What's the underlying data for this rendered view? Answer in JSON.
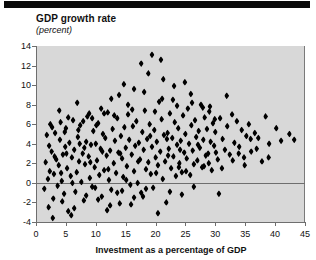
{
  "figure": {
    "title": "GDP growth rate",
    "subtitle": "(percent)",
    "xaxis_title": "Investment as a percentage of GDP"
  },
  "colors": {
    "marker": "#000000",
    "plot_background": "#d8d8d8",
    "axis": "#6e6e6e",
    "page_background": "#ffffff",
    "top_rule": "#0a0a0a"
  },
  "chart_data": {
    "type": "scatter",
    "title": "GDP growth rate",
    "subtitle": "(percent)",
    "xlabel": "Investment as a percentage of GDP",
    "ylabel": "GDP growth rate (percent)",
    "xlim": [
      0,
      45
    ],
    "ylim": [
      -4,
      14
    ],
    "xticks": [
      0,
      5,
      10,
      15,
      20,
      25,
      30,
      35,
      40,
      45
    ],
    "yticks": [
      -4,
      -2,
      0,
      2,
      4,
      6,
      8,
      10,
      12,
      14
    ],
    "grid": false,
    "legend": null,
    "zero_line": 0,
    "marker": "diamond",
    "n_points": 256,
    "points": [
      [
        1.4,
        -0.6
      ],
      [
        1.6,
        2.1
      ],
      [
        1.8,
        4.9
      ],
      [
        2.0,
        0.4
      ],
      [
        2.1,
        -2.5
      ],
      [
        2.3,
        1.2
      ],
      [
        2.4,
        6.0
      ],
      [
        2.6,
        3.2
      ],
      [
        2.8,
        -3.6
      ],
      [
        3.0,
        0.9
      ],
      [
        3.2,
        5.1
      ],
      [
        3.4,
        2.4
      ],
      [
        3.6,
        -0.3
      ],
      [
        3.8,
        1.8
      ],
      [
        4.0,
        4.4
      ],
      [
        4.1,
        6.2
      ],
      [
        4.3,
        0.2
      ],
      [
        4.5,
        2.9
      ],
      [
        4.7,
        -1.1
      ],
      [
        4.9,
        3.7
      ],
      [
        5.0,
        5.6
      ],
      [
        5.2,
        1.5
      ],
      [
        5.4,
        -2.9
      ],
      [
        5.6,
        4.1
      ],
      [
        5.8,
        0.7
      ],
      [
        6.0,
        2.6
      ],
      [
        6.2,
        6.4
      ],
      [
        6.4,
        3.4
      ],
      [
        6.6,
        -0.9
      ],
      [
        6.8,
        1.1
      ],
      [
        7.0,
        4.7
      ],
      [
        7.2,
        2.2
      ],
      [
        7.4,
        5.9
      ],
      [
        7.6,
        0.1
      ],
      [
        7.8,
        3.0
      ],
      [
        8.0,
        -1.8
      ],
      [
        8.2,
        1.9
      ],
      [
        8.4,
        4.2
      ],
      [
        8.6,
        6.8
      ],
      [
        8.8,
        2.7
      ],
      [
        9.0,
        0.5
      ],
      [
        9.2,
        3.9
      ],
      [
        9.4,
        -0.4
      ],
      [
        9.6,
        5.3
      ],
      [
        9.8,
        1.6
      ],
      [
        10.0,
        4.0
      ],
      [
        10.2,
        2.3
      ],
      [
        10.4,
        6.1
      ],
      [
        10.6,
        0.8
      ],
      [
        10.8,
        3.5
      ],
      [
        11.0,
        -1.4
      ],
      [
        11.2,
        5.0
      ],
      [
        11.4,
        1.3
      ],
      [
        11.6,
        4.6
      ],
      [
        11.8,
        2.8
      ],
      [
        12.0,
        7.2
      ],
      [
        12.2,
        0.3
      ],
      [
        12.4,
        3.3
      ],
      [
        12.6,
        -0.7
      ],
      [
        12.8,
        5.5
      ],
      [
        13.0,
        2.0
      ],
      [
        13.2,
        4.3
      ],
      [
        13.4,
        1.0
      ],
      [
        13.6,
        6.6
      ],
      [
        13.8,
        3.1
      ],
      [
        14.0,
        -2.1
      ],
      [
        14.2,
        4.8
      ],
      [
        14.4,
        2.5
      ],
      [
        14.6,
        0.6
      ],
      [
        14.8,
        5.7
      ],
      [
        15.0,
        3.6
      ],
      [
        15.2,
        1.7
      ],
      [
        15.4,
        7.0
      ],
      [
        15.6,
        4.4
      ],
      [
        15.8,
        -0.2
      ],
      [
        16.0,
        2.9
      ],
      [
        16.2,
        5.8
      ],
      [
        16.4,
        1.2
      ],
      [
        16.6,
        3.8
      ],
      [
        16.8,
        6.3
      ],
      [
        17.0,
        0.0
      ],
      [
        17.2,
        4.1
      ],
      [
        17.4,
        2.4
      ],
      [
        17.6,
        -1.0
      ],
      [
        17.8,
        5.2
      ],
      [
        18.0,
        3.4
      ],
      [
        18.2,
        7.4
      ],
      [
        18.4,
        1.4
      ],
      [
        18.6,
        4.5
      ],
      [
        18.8,
        2.1
      ],
      [
        19.0,
        6.0
      ],
      [
        19.2,
        0.9
      ],
      [
        19.4,
        3.7
      ],
      [
        19.6,
        -0.5
      ],
      [
        19.8,
        5.4
      ],
      [
        20.0,
        2.6
      ],
      [
        20.2,
        4.2
      ],
      [
        20.4,
        1.8
      ],
      [
        20.6,
        8.3
      ],
      [
        20.8,
        3.2
      ],
      [
        21.0,
        6.5
      ],
      [
        21.2,
        0.4
      ],
      [
        21.4,
        4.9
      ],
      [
        21.6,
        2.2
      ],
      [
        21.8,
        -2.0
      ],
      [
        22.0,
        5.1
      ],
      [
        22.2,
        3.5
      ],
      [
        22.4,
        7.1
      ],
      [
        22.6,
        1.5
      ],
      [
        22.8,
        4.6
      ],
      [
        23.0,
        2.7
      ],
      [
        23.2,
        6.2
      ],
      [
        23.4,
        0.7
      ],
      [
        23.6,
        3.9
      ],
      [
        23.8,
        5.6
      ],
      [
        24.0,
        2.0
      ],
      [
        24.2,
        4.3
      ],
      [
        24.4,
        1.1
      ],
      [
        24.6,
        6.9
      ],
      [
        24.8,
        3.1
      ],
      [
        25.0,
        5.0
      ],
      [
        25.2,
        2.5
      ],
      [
        25.4,
        7.6
      ],
      [
        25.6,
        4.0
      ],
      [
        25.8,
        0.8
      ],
      [
        26.0,
        5.9
      ],
      [
        26.2,
        3.3
      ],
      [
        26.4,
        1.9
      ],
      [
        26.6,
        6.4
      ],
      [
        26.8,
        4.7
      ],
      [
        27.0,
        2.3
      ],
      [
        27.2,
        5.3
      ],
      [
        27.4,
        3.6
      ],
      [
        27.6,
        8.0
      ],
      [
        27.8,
        1.6
      ],
      [
        28.0,
        4.4
      ],
      [
        28.2,
        6.7
      ],
      [
        28.4,
        2.8
      ],
      [
        28.6,
        5.5
      ],
      [
        28.8,
        3.0
      ],
      [
        29.0,
        7.3
      ],
      [
        29.2,
        4.2
      ],
      [
        29.4,
        1.3
      ],
      [
        29.6,
        6.1
      ],
      [
        29.8,
        3.8
      ],
      [
        30.0,
        5.2
      ],
      [
        30.4,
        2.4
      ],
      [
        30.8,
        6.6
      ],
      [
        31.2,
        4.5
      ],
      [
        31.6,
        3.4
      ],
      [
        32.0,
        5.8
      ],
      [
        32.4,
        2.9
      ],
      [
        32.8,
        7.0
      ],
      [
        33.2,
        4.1
      ],
      [
        33.6,
        6.3
      ],
      [
        34.0,
        3.7
      ],
      [
        34.4,
        5.4
      ],
      [
        34.8,
        2.6
      ],
      [
        35.2,
        4.8
      ],
      [
        35.6,
        6.0
      ],
      [
        36.0,
        3.2
      ],
      [
        36.6,
        5.1
      ],
      [
        37.2,
        4.6
      ],
      [
        37.8,
        2.2
      ],
      [
        38.4,
        6.8
      ],
      [
        39.0,
        4.0
      ],
      [
        40.2,
        5.6
      ],
      [
        41.0,
        4.3
      ],
      [
        42.4,
        5.0
      ],
      [
        2.2,
        3.8
      ],
      [
        3.1,
        2.7
      ],
      [
        4.2,
        1.0
      ],
      [
        5.1,
        3.0
      ],
      [
        6.1,
        0.0
      ],
      [
        7.1,
        5.4
      ],
      [
        8.1,
        3.6
      ],
      [
        9.1,
        2.1
      ],
      [
        10.1,
        5.9
      ],
      [
        11.1,
        3.2
      ],
      [
        12.1,
        1.4
      ],
      [
        13.1,
        6.9
      ],
      [
        14.1,
        3.0
      ],
      [
        15.1,
        0.3
      ],
      [
        16.1,
        7.5
      ],
      [
        17.1,
        2.2
      ],
      [
        18.1,
        9.3
      ],
      [
        19.1,
        4.8
      ],
      [
        20.1,
        1.0
      ],
      [
        21.1,
        8.6
      ],
      [
        22.1,
        2.8
      ],
      [
        23.1,
        9.9
      ],
      [
        24.1,
        3.4
      ],
      [
        25.1,
        1.2
      ],
      [
        26.1,
        8.2
      ],
      [
        27.1,
        3.9
      ],
      [
        28.1,
        1.7
      ],
      [
        29.1,
        7.8
      ],
      [
        30.1,
        3.1
      ],
      [
        31.1,
        1.5
      ],
      [
        19.4,
        13.1
      ],
      [
        16.4,
        9.6
      ],
      [
        12.6,
        8.6
      ],
      [
        14.7,
        10.1
      ],
      [
        18.8,
        11.2
      ],
      [
        21.3,
        10.6
      ],
      [
        23.6,
        7.9
      ],
      [
        25.9,
        9.1
      ],
      [
        10.9,
        7.6
      ],
      [
        8.9,
        7.1
      ],
      [
        6.9,
        8.2
      ],
      [
        17.6,
        12.2
      ],
      [
        20.9,
        12.6
      ],
      [
        13.9,
        9.0
      ],
      [
        22.9,
        8.5
      ],
      [
        27.9,
        7.7
      ],
      [
        24.9,
        10.3
      ],
      [
        29.9,
        6.5
      ],
      [
        31.9,
        8.9
      ],
      [
        4.4,
        -1.9
      ],
      [
        6.4,
        -2.6
      ],
      [
        8.4,
        -1.3
      ],
      [
        10.4,
        -1.7
      ],
      [
        12.4,
        -2.3
      ],
      [
        14.4,
        -0.8
      ],
      [
        16.4,
        -1.5
      ],
      [
        18.4,
        -0.6
      ],
      [
        20.4,
        -3.1
      ],
      [
        22.4,
        -0.9
      ],
      [
        24.4,
        -1.2
      ],
      [
        11.9,
        -2.8
      ],
      [
        2.9,
        -1.6
      ],
      [
        5.9,
        -3.3
      ],
      [
        9.9,
        -0.5
      ],
      [
        13.6,
        -1.0
      ],
      [
        15.9,
        -2.2
      ],
      [
        17.9,
        -1.4
      ],
      [
        26.4,
        -0.4
      ],
      [
        30.6,
        -1.1
      ],
      [
        3.9,
        7.4
      ],
      [
        5.4,
        6.7
      ],
      [
        7.9,
        6.3
      ],
      [
        9.4,
        6.6
      ],
      [
        11.4,
        7.1
      ],
      [
        15.4,
        8.0
      ],
      [
        19.9,
        7.3
      ],
      [
        2.7,
        5.7
      ],
      [
        4.8,
        5.2
      ],
      [
        7.3,
        4.0
      ],
      [
        35.9,
        4.5
      ],
      [
        33.9,
        3.0
      ],
      [
        36.9,
        3.5
      ],
      [
        38.9,
        2.6
      ],
      [
        43.2,
        4.4
      ],
      [
        21.9,
        4.5
      ],
      [
        23.9,
        1.6
      ],
      [
        28.9,
        2.0
      ],
      [
        32.9,
        2.3
      ],
      [
        34.9,
        1.8
      ]
    ]
  }
}
